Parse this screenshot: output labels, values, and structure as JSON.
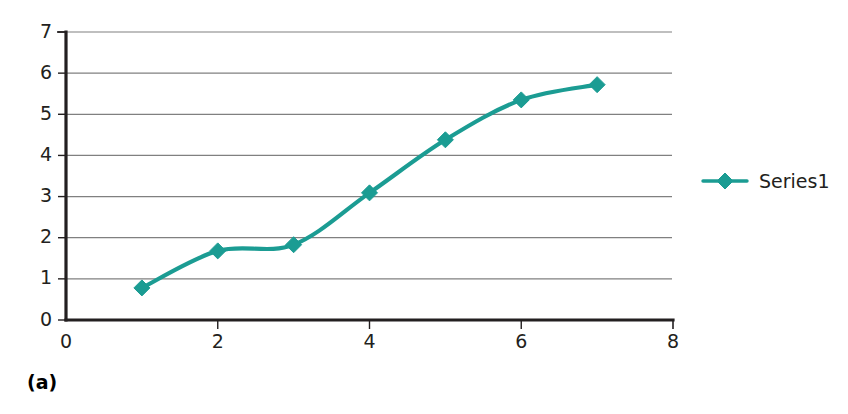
{
  "caption": "(a)",
  "colors": {
    "series": "#1b9c93",
    "axis": "#231f20",
    "gridline": "#808080",
    "background": "#ffffff",
    "text": "#231f20"
  },
  "legend": {
    "position": "right",
    "entries": [
      {
        "label": "Series1",
        "marker": "diamond-marker",
        "color": "#1b9c93"
      }
    ]
  },
  "chart_data": {
    "type": "line",
    "title": "",
    "subtitle": "",
    "xlabel": "",
    "ylabel": "",
    "xlim": [
      0,
      8
    ],
    "ylim": [
      0,
      7
    ],
    "grid": "horizontal",
    "xticks": [
      0,
      2,
      4,
      6,
      8
    ],
    "xtick_labels": [
      "0",
      "2",
      "4",
      "6",
      "8"
    ],
    "yticks": [
      0,
      1,
      2,
      3,
      4,
      5,
      6,
      7
    ],
    "ytick_labels": [
      "0",
      "1",
      "2",
      "3",
      "4",
      "5",
      "6",
      "7"
    ],
    "legend_position": "right",
    "marker": "diamond",
    "series": [
      {
        "name": "Series1",
        "color": "#1b9c93",
        "x": [
          1,
          2,
          3,
          4,
          5,
          6,
          7
        ],
        "values": [
          0.78,
          1.68,
          1.83,
          3.09,
          4.38,
          5.35,
          5.72
        ]
      }
    ]
  }
}
